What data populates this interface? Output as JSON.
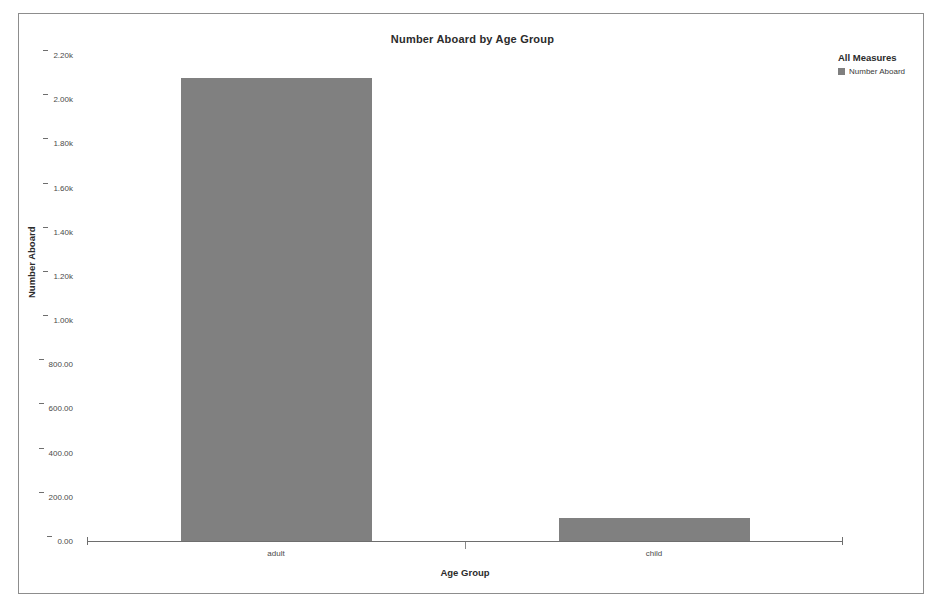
{
  "chart_data": {
    "type": "bar",
    "title": "Number Aboard by Age Group",
    "xlabel": "Age Group",
    "ylabel": "Number Aboard",
    "categories": [
      "adult",
      "child"
    ],
    "values": [
      2095,
      105
    ],
    "series": [
      {
        "name": "Number Aboard",
        "values": [
          2095,
          105
        ]
      }
    ],
    "ylim": [
      0,
      2200
    ],
    "ytick_values": [
      0,
      200,
      400,
      600,
      800,
      1000,
      1200,
      1400,
      1600,
      1800,
      2000,
      2200
    ],
    "ytick_labels": [
      "0.00",
      "200.00",
      "400.00",
      "600.00",
      "800.00",
      "1.00k",
      "1.20k",
      "1.40k",
      "1.60k",
      "1.80k",
      "2.00k",
      "2.20k"
    ],
    "grid": false,
    "legend_position": "top-right",
    "bar_color": "#808080"
  },
  "legend": {
    "title": "All Measures",
    "entries": [
      {
        "label": "Number Aboard",
        "color": "#7f7f7f",
        "swatch": "square-swatch-icon"
      }
    ]
  },
  "axis": {
    "y_ticks": [
      {
        "label": "2.20k",
        "value": 2200
      },
      {
        "label": "2.00k",
        "value": 2000
      },
      {
        "label": "1.80k",
        "value": 1800
      },
      {
        "label": "1.60k",
        "value": 1600
      },
      {
        "label": "1.40k",
        "value": 1400
      },
      {
        "label": "1.20k",
        "value": 1200
      },
      {
        "label": "1.00k",
        "value": 1000
      },
      {
        "label": "800.00",
        "value": 800
      },
      {
        "label": "600.00",
        "value": 600
      },
      {
        "label": "400.00",
        "value": 400
      },
      {
        "label": "200.00",
        "value": 200
      },
      {
        "label": "0.00",
        "value": 0
      }
    ]
  }
}
